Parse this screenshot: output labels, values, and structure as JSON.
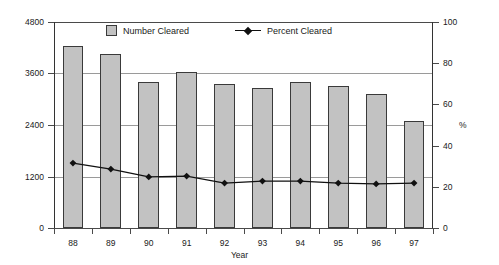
{
  "chart_data": {
    "type": "bar",
    "title": "",
    "subtitle": "",
    "xlabel": "Year",
    "ylabel": "",
    "y2label": "%",
    "categories": [
      "88",
      "89",
      "90",
      "91",
      "92",
      "93",
      "94",
      "95",
      "96",
      "97"
    ],
    "ylim": [
      0,
      4800
    ],
    "y2lim": [
      0,
      100
    ],
    "yticks": [
      0,
      1200,
      2400,
      3600,
      4800
    ],
    "y2ticks": [
      0,
      20,
      40,
      60,
      80,
      100
    ],
    "grid": true,
    "grid_axis": "y",
    "legend_position": "top-center-inside",
    "series": [
      {
        "name": "Number Cleared",
        "type": "bar",
        "axis": "left",
        "color": "#c2c2c2",
        "edge_color": "#3a3a3a",
        "values": [
          4240,
          4050,
          3400,
          3630,
          3355,
          3260,
          3400,
          3310,
          3120,
          2490
        ]
      },
      {
        "name": "Percent Cleared",
        "type": "line",
        "axis": "right",
        "color": "#111111",
        "marker": "diamond",
        "values": [
          31.5,
          28.6,
          24.8,
          25.2,
          21.8,
          22.8,
          22.8,
          21.8,
          21.4,
          21.8
        ]
      }
    ]
  },
  "legend": {
    "items": [
      {
        "label": "Number Cleared",
        "marker": "square-swatch"
      },
      {
        "label": "Percent Cleared",
        "marker": "line-diamond-swatch"
      }
    ]
  },
  "axes": {
    "left_tick_labels": [
      "4800",
      "3600",
      "2400",
      "1200",
      "0"
    ],
    "right_tick_labels": [
      "100",
      "80",
      "60",
      "40",
      "20",
      "0"
    ],
    "right_unit_label": "%",
    "x_tick_labels": [
      "88",
      "89",
      "90",
      "91",
      "92",
      "93",
      "94",
      "95",
      "96",
      "97"
    ],
    "x_title": "Year"
  }
}
